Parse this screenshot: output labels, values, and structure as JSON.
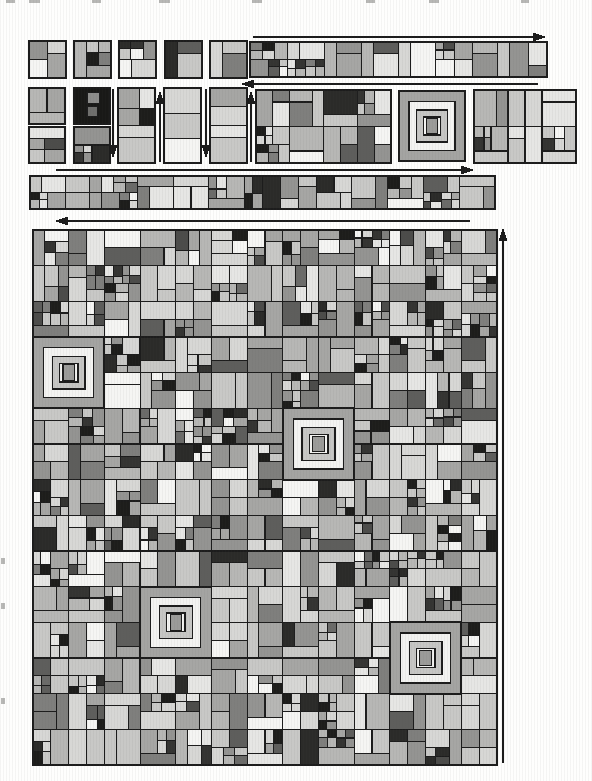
{
  "figure": {
    "background": "#fefefd",
    "ink": "#1c1c1c",
    "seed": 8,
    "palette": {
      "shades": [
        "#f5f5f3",
        "#e6e6e4",
        "#d7d7d5",
        "#c8c8c6",
        "#b7b7b5",
        "#a6a6a4",
        "#949492",
        "#7f7f7d",
        "#5e5e5c",
        "#2b2b29"
      ],
      "weights": [
        8,
        9,
        14,
        16,
        16,
        13,
        10,
        7,
        4,
        3
      ],
      "accents": [
        "#1d1d1b",
        "#343432",
        "#4c4c4a",
        "#6b6b69"
      ],
      "accent_weights": [
        4,
        3,
        2,
        1
      ]
    },
    "gen": {
      "depth": 2,
      "ratios": [
        0.33,
        0.5,
        0.5,
        0.67
      ],
      "flat_prob": 0.3,
      "window_prob": 0.34
    },
    "concentric": {
      "insets": [
        0,
        0.15,
        0.27,
        0.37
      ],
      "rings": [
        "#a4a4a2",
        "#f3f3f1",
        "#c6c6c4",
        "#f3f3f1"
      ],
      "core": {
        "w": 0.16,
        "h": 0.22,
        "color": "#9b9b99"
      }
    },
    "dark_tile": {
      "bg": "#191917",
      "cells": [
        {
          "x": 0.36,
          "y": 0.12,
          "w": 0.34,
          "h": 0.32,
          "c": "#8d8d8b"
        },
        {
          "x": 0.36,
          "y": 0.52,
          "w": 0.28,
          "h": 0.28,
          "c": "#6f6f6d"
        }
      ]
    },
    "stage1": {
      "tiles_x": [
        29,
        74,
        119,
        165,
        210
      ],
      "y": 41,
      "size": 37,
      "strip": {
        "x": 250,
        "y": 42,
        "w": 297,
        "h": 35,
        "cells": 8
      }
    },
    "stage2": {
      "size": 36,
      "stack_y": [
        88,
        127
      ],
      "stacks": [
        {
          "x": 29,
          "tiles": [
            "quilt",
            "quilt"
          ]
        },
        {
          "x": 74,
          "tiles": [
            "dark",
            "quilt"
          ]
        }
      ],
      "talls": [
        118,
        164,
        210
      ],
      "tall": {
        "y": 88,
        "w": 37,
        "h": 75
      },
      "blocks": [
        {
          "type": "grid",
          "x": 256,
          "y": 90,
          "w": 135,
          "h": 73,
          "cols": 4,
          "rows": 2
        },
        {
          "type": "concentric",
          "x": 399,
          "y": 91,
          "w": 66,
          "h": 70
        },
        {
          "type": "grid",
          "x": 474,
          "y": 90,
          "w": 102,
          "h": 73,
          "cols": 3,
          "rows": 2
        }
      ]
    },
    "stage3": {
      "strip": {
        "x": 30,
        "y": 176,
        "w": 465,
        "h": 33,
        "cells": 13
      }
    },
    "mosaic": {
      "x": 33,
      "y": 230,
      "w": 464,
      "h": 535,
      "cols": 13,
      "rows": 15,
      "specials": [
        {
          "col": 0,
          "row": 3
        },
        {
          "col": 7,
          "row": 5
        },
        {
          "col": 3,
          "row": 10
        },
        {
          "col": 10,
          "row": 11
        }
      ]
    },
    "arrows": [
      {
        "name": "stage1-strip-scan-arrow",
        "dir": "right",
        "x1": 253,
        "y1": 37,
        "x2": 546,
        "y2": 37
      },
      {
        "name": "stage2-row-scan-arrow",
        "dir": "left",
        "x1": 538,
        "y1": 84,
        "x2": 241,
        "y2": 84
      },
      {
        "name": "pair-1-scan-arrow",
        "dir": "down",
        "x1": 113,
        "y1": 89,
        "x2": 113,
        "y2": 158
      },
      {
        "name": "pair-2-scan-arrow",
        "dir": "up",
        "x1": 160,
        "y1": 162,
        "x2": 160,
        "y2": 91
      },
      {
        "name": "pair-3-scan-arrow",
        "dir": "down",
        "x1": 206,
        "y1": 89,
        "x2": 206,
        "y2": 158
      },
      {
        "name": "pair-4-scan-arrow",
        "dir": "up",
        "x1": 251,
        "y1": 162,
        "x2": 251,
        "y2": 91
      },
      {
        "name": "stage3-strip-scan-arrow",
        "dir": "right",
        "x1": 56,
        "y1": 170,
        "x2": 474,
        "y2": 170
      },
      {
        "name": "mosaic-row-scan-arrow",
        "dir": "left",
        "x1": 470,
        "y1": 221,
        "x2": 55,
        "y2": 221
      },
      {
        "name": "mosaic-column-scan-arrow",
        "dir": "up",
        "x1": 503,
        "y1": 763,
        "x2": 503,
        "y2": 228
      }
    ],
    "artifacts": {
      "color": "#b8b8b6",
      "top_dashes": [
        [
          6,
          0,
          9,
          3
        ],
        [
          29,
          0,
          11,
          3
        ],
        [
          92,
          0,
          9,
          3
        ],
        [
          159,
          0,
          11,
          3
        ],
        [
          252,
          0,
          10,
          3
        ],
        [
          366,
          0,
          9,
          3
        ],
        [
          429,
          0,
          10,
          3
        ],
        [
          521,
          0,
          8,
          3
        ]
      ],
      "left_specks": [
        [
          1,
          558,
          4,
          6
        ],
        [
          1,
          603,
          4,
          6
        ],
        [
          1,
          698,
          4,
          6
        ]
      ]
    }
  }
}
